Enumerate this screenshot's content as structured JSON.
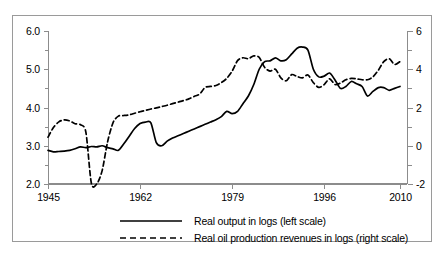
{
  "chart_data": {
    "type": "line",
    "title": "",
    "subtitle": "",
    "xlabel": "",
    "ylabel": "",
    "grid": false,
    "legend_position": "bottom",
    "xlim": [
      1945,
      2010
    ],
    "xticks": [
      1945,
      1962,
      1979,
      1996,
      2010
    ],
    "xticklabels": [
      "1945",
      "1962",
      "1979",
      "1996",
      "2010"
    ],
    "axes": [
      {
        "name": "left",
        "label": "Real output in logs (left scale)",
        "ylim": [
          2.0,
          6.0
        ],
        "yticks": [
          2.0,
          3.0,
          4.0,
          5.0,
          6.0
        ],
        "yticklabels": [
          "2.0",
          "3.0",
          "4.0",
          "5.0",
          "6.0"
        ],
        "minor_tick_step": 0.5
      },
      {
        "name": "right",
        "label": "Real oil production revenues in logs (right scale)",
        "ylim": [
          -2,
          6
        ],
        "yticks": [
          -2,
          0,
          2,
          4,
          6
        ],
        "yticklabels": [
          "-2",
          "0",
          "2",
          "4",
          "6"
        ],
        "minor_tick_step": 1
      }
    ],
    "series": [
      {
        "name": "Real output in logs (left scale)",
        "axis": "left",
        "style": "solid",
        "color": "#000000",
        "x": [
          1945,
          1946,
          1947,
          1948,
          1949,
          1950,
          1951,
          1952,
          1953,
          1954,
          1955,
          1956,
          1957,
          1958,
          1959,
          1960,
          1961,
          1962,
          1963,
          1964,
          1965,
          1966,
          1967,
          1968,
          1969,
          1970,
          1971,
          1972,
          1973,
          1974,
          1975,
          1976,
          1977,
          1978,
          1979,
          1980,
          1981,
          1982,
          1983,
          1984,
          1985,
          1986,
          1987,
          1988,
          1989,
          1990,
          1991,
          1992,
          1993,
          1994,
          1995,
          1996,
          1997,
          1998,
          1999,
          2000,
          2001,
          2002,
          2003,
          2004,
          2005,
          2006,
          2007,
          2008,
          2009,
          2010
        ],
        "y": [
          2.88,
          2.84,
          2.85,
          2.86,
          2.88,
          2.92,
          2.97,
          2.95,
          2.98,
          2.97,
          3.0,
          2.95,
          2.92,
          2.88,
          3.05,
          3.25,
          3.45,
          3.58,
          3.62,
          3.6,
          3.08,
          3.0,
          3.12,
          3.2,
          3.26,
          3.32,
          3.38,
          3.44,
          3.5,
          3.56,
          3.62,
          3.68,
          3.76,
          3.9,
          3.84,
          3.9,
          4.1,
          4.3,
          4.6,
          5.0,
          5.2,
          5.22,
          5.3,
          5.22,
          5.25,
          5.4,
          5.55,
          5.58,
          5.5,
          5.0,
          4.8,
          4.82,
          4.9,
          4.72,
          4.5,
          4.55,
          4.68,
          4.62,
          4.55,
          4.3,
          4.42,
          4.52,
          4.52,
          4.45,
          4.5,
          4.55
        ]
      },
      {
        "name": "Real oil production revenues in logs (right scale)",
        "axis": "right",
        "style": "dashed",
        "color": "#000000",
        "x": [
          1945,
          1946,
          1947,
          1948,
          1949,
          1950,
          1951,
          1952,
          1953,
          1954,
          1955,
          1956,
          1957,
          1958,
          1959,
          1960,
          1961,
          1962,
          1963,
          1964,
          1965,
          1966,
          1967,
          1968,
          1969,
          1970,
          1971,
          1972,
          1973,
          1974,
          1975,
          1976,
          1977,
          1978,
          1979,
          1980,
          1981,
          1982,
          1983,
          1984,
          1985,
          1986,
          1987,
          1988,
          1989,
          1990,
          1991,
          1992,
          1993,
          1994,
          1995,
          1996,
          1997,
          1998,
          1999,
          2000,
          2001,
          2002,
          2003,
          2004,
          2005,
          2006,
          2007,
          2008,
          2009,
          2010
        ],
        "y": [
          0.45,
          0.95,
          1.25,
          1.35,
          1.3,
          1.15,
          1.1,
          0.7,
          -1.95,
          -2.0,
          -1.3,
          0.2,
          1.2,
          1.55,
          1.58,
          1.62,
          1.7,
          1.78,
          1.85,
          1.92,
          1.98,
          2.05,
          2.12,
          2.2,
          2.28,
          2.36,
          2.45,
          2.58,
          2.7,
          3.05,
          3.1,
          3.15,
          3.3,
          3.52,
          3.9,
          4.45,
          4.6,
          4.55,
          4.7,
          4.62,
          4.1,
          3.9,
          4.0,
          3.55,
          3.4,
          3.72,
          3.62,
          3.55,
          3.7,
          3.3,
          3.05,
          3.2,
          3.5,
          3.2,
          3.28,
          3.45,
          3.52,
          3.5,
          3.45,
          3.45,
          3.6,
          3.95,
          4.4,
          4.55,
          4.25,
          4.4
        ]
      }
    ]
  },
  "legend": {
    "items": [
      {
        "label": "Real output in logs (left scale)",
        "style": "solid"
      },
      {
        "label": "Real oil production revenues in logs (right scale)",
        "style": "dashed"
      }
    ]
  }
}
